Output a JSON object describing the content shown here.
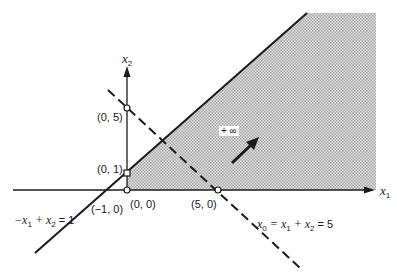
{
  "diagram": {
    "axes": {
      "x_label": "x",
      "x_sub": "1",
      "y_label": "x",
      "y_sub": "2"
    },
    "points": [
      {
        "label": "(0, 5)"
      },
      {
        "label": "(0, 1)"
      },
      {
        "label": "(0, 0)"
      },
      {
        "label": "(−1, 0)"
      },
      {
        "label": "(5, 0)"
      }
    ],
    "constraint_line": {
      "label_parts": [
        "−x",
        "1",
        " + x",
        "2",
        " = 1"
      ]
    },
    "objective_line": {
      "label_parts": [
        "x",
        "0",
        " = x",
        "1",
        " + x",
        "2",
        " = 5"
      ]
    },
    "direction": {
      "label": "+ ∞"
    },
    "colors": {
      "line": "#1a1a1a",
      "shade": "#c8c8c8"
    }
  }
}
